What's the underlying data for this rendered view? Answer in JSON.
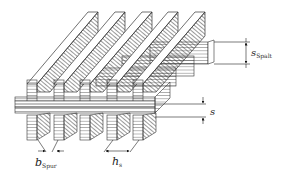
{
  "diagram": {
    "colors": {
      "stroke": "#333333",
      "face": "#ffffff",
      "hatch": "#444444"
    },
    "labels": {
      "s_spalt": {
        "main": "s",
        "sub": "Spalt"
      },
      "s": {
        "main": "s"
      },
      "b_spur": {
        "main": "b",
        "sub": "Spur"
      },
      "h_s": {
        "main": "h",
        "sub": "s"
      }
    },
    "counts": {
      "top_bars": 5,
      "bottom_blocks": 5
    }
  }
}
